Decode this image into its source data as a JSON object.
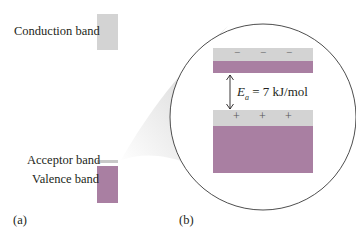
{
  "labels": {
    "conduction_band": "Conduction band",
    "acceptor_band": "Acceptor band",
    "valence_band": "Valence band",
    "panel_a": "(a)",
    "panel_b": "(b)"
  },
  "energy_label": {
    "symbol": "E",
    "subscript": "a",
    "value_text": " = 7 kJ/mol"
  },
  "charges": {
    "negative": [
      "−",
      "−",
      "−"
    ],
    "positive": [
      "+",
      "+",
      "+"
    ]
  },
  "colors": {
    "band_gray": "#d3d3d3",
    "band_purple": "#a97fa2",
    "acceptor_gray": "#cccccc",
    "magnifier_shadow": "#e4e4e4",
    "line": "#333333"
  }
}
